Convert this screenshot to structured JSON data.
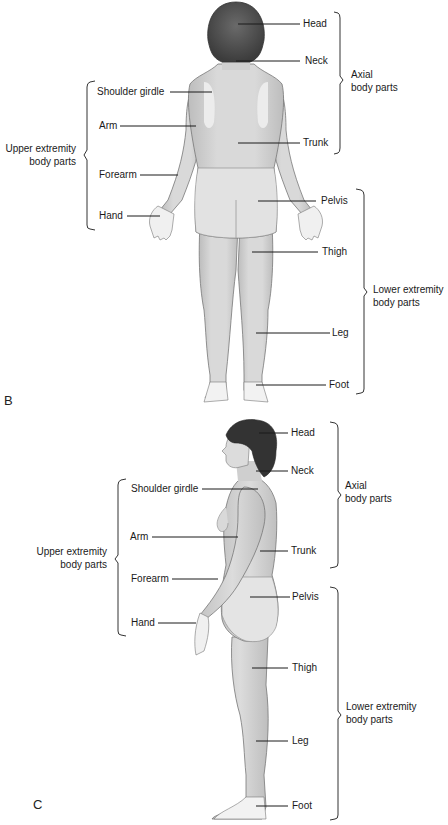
{
  "figures": [
    {
      "panel_letter": "B",
      "view": "posterior",
      "labels": {
        "head": "Head",
        "neck": "Neck",
        "shoulder_girdle": "Shoulder girdle",
        "arm": "Arm",
        "trunk": "Trunk",
        "forearm": "Forearm",
        "pelvis": "Pelvis",
        "hand": "Hand",
        "thigh": "Thigh",
        "leg": "Leg",
        "foot": "Foot"
      },
      "groups": {
        "axial_line1": "Axial",
        "axial_line2": "body parts",
        "upper_line1": "Upper extremity",
        "upper_line2": "body parts",
        "lower_line1": "Lower extremity",
        "lower_line2": "body parts"
      }
    },
    {
      "panel_letter": "C",
      "view": "lateral",
      "labels": {
        "head": "Head",
        "neck": "Neck",
        "shoulder_girdle": "Shoulder girdle",
        "arm": "Arm",
        "trunk": "Trunk",
        "forearm": "Forearm",
        "pelvis": "Pelvis",
        "hand": "Hand",
        "thigh": "Thigh",
        "leg": "Leg",
        "foot": "Foot"
      },
      "groups": {
        "axial_line1": "Axial",
        "axial_line2": "body parts",
        "upper_line1": "Upper extremity",
        "upper_line2": "body parts",
        "lower_line1": "Lower extremity",
        "lower_line2": "body parts"
      }
    }
  ],
  "colors": {
    "hair": "#4a4a4a",
    "skin": "#d6d6d6",
    "skin_light": "#e6e6e6",
    "highlight": "#efefef",
    "outline": "#555555",
    "leader": "#1a1a1a"
  }
}
